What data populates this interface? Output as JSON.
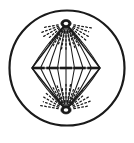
{
  "figure": {
    "caption": "",
    "background_color": "#ffffff",
    "ink_color": "#1a1a1a",
    "canvas": {
      "width": 134,
      "height": 143
    }
  },
  "cell_membrane": {
    "label": "cell outline",
    "shape": "circle",
    "center_x": 67,
    "center_y": 68,
    "radius": 57.5,
    "stroke_color": "#1a1a1a",
    "stroke_width": 2.2,
    "fill": "none"
  },
  "poles": [
    {
      "name": "upper-centrosome",
      "label": "centrosome",
      "x": 66,
      "y": 23.5,
      "outer_rx": 5.2,
      "outer_ry": 4.0,
      "inner_rx": 2.3,
      "inner_ry": 1.7,
      "outer_color": "#1a1a1a",
      "inner_color": "#ffffff",
      "aster_rays": 17,
      "aster_angle_start": 190,
      "aster_angle_end": 350,
      "aster_inner_radius": 8,
      "aster_outer_radius": 27
    },
    {
      "name": "lower-centrosome",
      "label": "centrosome",
      "x": 66,
      "y": 110,
      "outer_rx": 5.2,
      "outer_ry": 4.0,
      "inner_rx": 2.3,
      "inner_ry": 1.7,
      "outer_color": "#1a1a1a",
      "inner_color": "#ffffff",
      "aster_rays": 17,
      "aster_angle_start": 10,
      "aster_angle_end": 170,
      "aster_inner_radius": 8,
      "aster_outer_radius": 27
    }
  ],
  "spindle": {
    "label": "mitotic spindle",
    "top_pole_x": 66,
    "top_pole_y": 23.5,
    "bottom_pole_x": 66,
    "bottom_pole_y": 110,
    "equator_y": 68,
    "stroke_color": "#1a1a1a",
    "fiber_count": 9,
    "fiber_stroke_width": 1.05,
    "outline_stroke_width": 1.5,
    "equator_half_width": 34,
    "fiber_equator_offsets": [
      -34,
      -25.5,
      -17,
      -8.5,
      0,
      8.5,
      17,
      25.5,
      34
    ]
  },
  "chromosomes": {
    "label": "chromosomes at metaphase plate",
    "count": 5,
    "y": 68,
    "dash_half_length": 6.2,
    "stroke_width": 2.6,
    "stroke_color": "#1a1a1a",
    "centers_x": [
      38.5,
      52.5,
      66,
      79.5,
      93.5
    ]
  },
  "equatorial_line": {
    "label": "metaphase plate guide line",
    "y": 68,
    "x_start": 32,
    "x_end": 100,
    "stroke_width": 0.9,
    "stroke_color": "#1a1a1a"
  }
}
